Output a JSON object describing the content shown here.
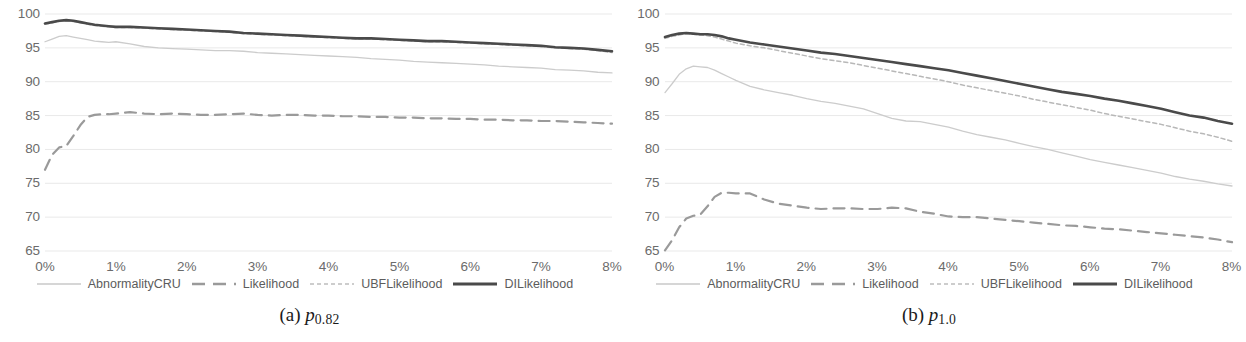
{
  "figure": {
    "panels": [
      {
        "id": "a",
        "caption_tag": "(a)",
        "caption_symbol": "p",
        "caption_sub": "0.82"
      },
      {
        "id": "b",
        "caption_tag": "(b)",
        "caption_symbol": "p",
        "caption_sub": "1.0"
      }
    ],
    "legend": [
      {
        "label": "AbnormalityCRU",
        "style": "thin-solid",
        "color": "#c9c9c9"
      },
      {
        "label": "Likelihood",
        "style": "long-dash",
        "color": "#9a9a9a"
      },
      {
        "label": "UBFLikelihood",
        "style": "fine-dash",
        "color": "#bdbdbd"
      },
      {
        "label": "DILikelihood",
        "style": "thick-solid",
        "color": "#4a4a4a"
      }
    ]
  },
  "chart_data": [
    {
      "type": "line",
      "title": "(a) p_0.82",
      "xlabel": "",
      "ylabel": "",
      "xlim": [
        0,
        8
      ],
      "ylim": [
        65,
        100
      ],
      "yticks": [
        100,
        95,
        90,
        85,
        80,
        75,
        70,
        65
      ],
      "xticks": [
        "0%",
        "1%",
        "2%",
        "3%",
        "4%",
        "5%",
        "6%",
        "7%",
        "8%"
      ],
      "grid": true,
      "legend_position": "bottom",
      "x": [
        0,
        0.1,
        0.2,
        0.3,
        0.4,
        0.5,
        0.6,
        0.7,
        0.8,
        0.9,
        1.0,
        1.2,
        1.4,
        1.6,
        1.8,
        2.0,
        2.2,
        2.4,
        2.6,
        2.8,
        3.0,
        3.2,
        3.4,
        3.6,
        3.8,
        4.0,
        4.2,
        4.4,
        4.6,
        4.8,
        5.0,
        5.2,
        5.4,
        5.6,
        5.8,
        6.0,
        6.2,
        6.4,
        6.6,
        6.8,
        7.0,
        7.2,
        7.4,
        7.6,
        7.8,
        8.0
      ],
      "series": [
        {
          "name": "DILikelihood",
          "values": [
            98.6,
            98.8,
            99.0,
            99.1,
            99.0,
            98.8,
            98.6,
            98.4,
            98.3,
            98.2,
            98.1,
            98.1,
            98.0,
            97.9,
            97.8,
            97.7,
            97.6,
            97.5,
            97.4,
            97.2,
            97.1,
            97.0,
            96.9,
            96.8,
            96.7,
            96.6,
            96.5,
            96.4,
            96.4,
            96.3,
            96.2,
            96.1,
            96.0,
            96.0,
            95.9,
            95.8,
            95.7,
            95.6,
            95.5,
            95.4,
            95.3,
            95.1,
            95.0,
            94.9,
            94.7,
            94.5
          ]
        },
        {
          "name": "UBFLikelihood",
          "values": [
            98.5,
            98.7,
            98.9,
            99.0,
            98.9,
            98.7,
            98.5,
            98.3,
            98.2,
            98.1,
            98.0,
            98.0,
            97.9,
            97.8,
            97.7,
            97.6,
            97.5,
            97.4,
            97.3,
            97.1,
            97.0,
            96.9,
            96.8,
            96.7,
            96.6,
            96.5,
            96.4,
            96.3,
            96.3,
            96.2,
            96.1,
            96.0,
            95.9,
            95.9,
            95.8,
            95.7,
            95.6,
            95.5,
            95.4,
            95.3,
            95.2,
            95.0,
            94.9,
            94.8,
            94.6,
            94.3
          ]
        },
        {
          "name": "AbnormalityCRU",
          "values": [
            95.9,
            96.3,
            96.7,
            96.8,
            96.6,
            96.4,
            96.2,
            96.0,
            95.9,
            95.8,
            95.9,
            95.6,
            95.2,
            95.0,
            94.9,
            94.8,
            94.7,
            94.6,
            94.6,
            94.5,
            94.3,
            94.2,
            94.1,
            94.0,
            93.9,
            93.8,
            93.7,
            93.6,
            93.4,
            93.3,
            93.2,
            93.0,
            92.9,
            92.8,
            92.7,
            92.6,
            92.5,
            92.3,
            92.2,
            92.1,
            92.0,
            91.8,
            91.7,
            91.6,
            91.4,
            91.3
          ]
        },
        {
          "name": "Likelihood",
          "values": [
            77.0,
            79.2,
            80.3,
            80.5,
            82.0,
            83.6,
            84.8,
            85.1,
            85.2,
            85.2,
            85.3,
            85.5,
            85.3,
            85.2,
            85.3,
            85.2,
            85.1,
            85.1,
            85.2,
            85.3,
            85.1,
            85.0,
            85.1,
            85.1,
            85.0,
            85.0,
            84.9,
            84.9,
            84.8,
            84.8,
            84.7,
            84.7,
            84.6,
            84.6,
            84.5,
            84.5,
            84.4,
            84.4,
            84.3,
            84.3,
            84.2,
            84.2,
            84.1,
            84.0,
            83.9,
            83.8
          ]
        }
      ]
    },
    {
      "type": "line",
      "title": "(b) p_1.0",
      "xlabel": "",
      "ylabel": "",
      "xlim": [
        0,
        8
      ],
      "ylim": [
        65,
        100
      ],
      "yticks": [
        100,
        95,
        90,
        85,
        80,
        75,
        70,
        65
      ],
      "xticks": [
        "0%",
        "1%",
        "2%",
        "3%",
        "4%",
        "5%",
        "6%",
        "7%",
        "8%"
      ],
      "grid": true,
      "legend_position": "bottom",
      "x": [
        0,
        0.1,
        0.2,
        0.3,
        0.4,
        0.5,
        0.6,
        0.7,
        0.8,
        0.9,
        1.0,
        1.2,
        1.4,
        1.6,
        1.8,
        2.0,
        2.2,
        2.4,
        2.6,
        2.8,
        3.0,
        3.2,
        3.4,
        3.6,
        3.8,
        4.0,
        4.2,
        4.4,
        4.6,
        4.8,
        5.0,
        5.2,
        5.4,
        5.6,
        5.8,
        6.0,
        6.2,
        6.4,
        6.6,
        6.8,
        7.0,
        7.2,
        7.4,
        7.6,
        7.8,
        8.0
      ],
      "series": [
        {
          "name": "DILikelihood",
          "values": [
            96.6,
            96.9,
            97.1,
            97.2,
            97.1,
            97.0,
            97.0,
            96.9,
            96.7,
            96.4,
            96.2,
            95.8,
            95.5,
            95.2,
            94.9,
            94.6,
            94.3,
            94.1,
            93.8,
            93.5,
            93.2,
            92.9,
            92.6,
            92.3,
            92.0,
            91.7,
            91.3,
            90.9,
            90.5,
            90.1,
            89.7,
            89.3,
            88.9,
            88.5,
            88.2,
            87.9,
            87.5,
            87.2,
            86.8,
            86.4,
            86.0,
            85.5,
            85.0,
            84.7,
            84.2,
            83.8
          ]
        },
        {
          "name": "UBFLikelihood",
          "values": [
            96.4,
            96.7,
            96.9,
            97.1,
            97.0,
            96.9,
            96.8,
            96.6,
            96.3,
            96.0,
            95.7,
            95.3,
            95.0,
            94.6,
            94.2,
            93.8,
            93.4,
            93.1,
            92.8,
            92.4,
            92.0,
            91.6,
            91.2,
            90.8,
            90.4,
            90.0,
            89.5,
            89.1,
            88.7,
            88.3,
            87.9,
            87.4,
            87.0,
            86.6,
            86.2,
            85.8,
            85.3,
            84.9,
            84.5,
            84.1,
            83.7,
            83.2,
            82.7,
            82.3,
            81.8,
            81.2
          ]
        },
        {
          "name": "AbnormalityCRU",
          "values": [
            88.4,
            89.7,
            91.1,
            91.9,
            92.3,
            92.2,
            92.1,
            91.7,
            91.2,
            90.7,
            90.2,
            89.3,
            88.8,
            88.4,
            88.0,
            87.5,
            87.1,
            86.8,
            86.4,
            86.0,
            85.3,
            84.6,
            84.2,
            84.1,
            83.7,
            83.3,
            82.7,
            82.2,
            81.8,
            81.4,
            80.9,
            80.4,
            80.0,
            79.5,
            79.0,
            78.5,
            78.1,
            77.7,
            77.3,
            76.9,
            76.5,
            76.0,
            75.6,
            75.3,
            74.9,
            74.6
          ]
        },
        {
          "name": "Likelihood",
          "values": [
            65.1,
            66.6,
            68.5,
            69.8,
            70.2,
            70.4,
            71.6,
            73.0,
            73.6,
            73.6,
            73.5,
            73.5,
            72.6,
            72.0,
            71.7,
            71.4,
            71.2,
            71.3,
            71.3,
            71.2,
            71.2,
            71.4,
            71.3,
            70.8,
            70.5,
            70.1,
            70.0,
            70.0,
            69.8,
            69.6,
            69.4,
            69.2,
            69.0,
            68.8,
            68.7,
            68.5,
            68.3,
            68.2,
            68.0,
            67.8,
            67.6,
            67.4,
            67.2,
            67.0,
            66.7,
            66.3
          ]
        }
      ]
    }
  ]
}
